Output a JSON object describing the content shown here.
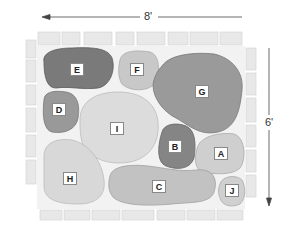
{
  "diagram": {
    "type": "patio stone layout",
    "dimensions": {
      "width_label": "8'",
      "height_label": "6'"
    },
    "stones": [
      {
        "id": "E",
        "label": "E",
        "shade": "#7a7a7a"
      },
      {
        "id": "F",
        "label": "F",
        "shade": "#c8c8c8"
      },
      {
        "id": "G",
        "label": "G",
        "shade": "#9a9a9a"
      },
      {
        "id": "D",
        "label": "D",
        "shade": "#999999"
      },
      {
        "id": "I",
        "label": "I",
        "shade": "#dcdcdc"
      },
      {
        "id": "B",
        "label": "B",
        "shade": "#858585"
      },
      {
        "id": "A",
        "label": "A",
        "shade": "#cfcfcf"
      },
      {
        "id": "H",
        "label": "H",
        "shade": "#d8d8d8"
      },
      {
        "id": "C",
        "label": "C",
        "shade": "#c2c2c2"
      },
      {
        "id": "J",
        "label": "J",
        "shade": "#d0d0d0"
      }
    ],
    "colors": {
      "border_brick": "#e6e6e6",
      "mortar": "#f0f0f0",
      "arrow": "#444444"
    }
  }
}
